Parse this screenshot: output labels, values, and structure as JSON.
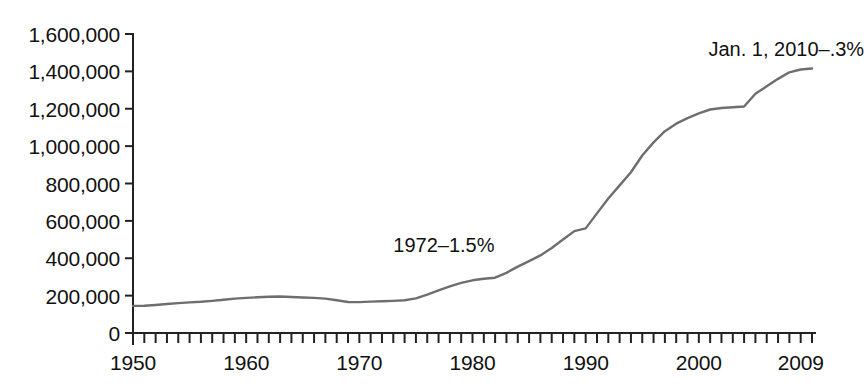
{
  "chart_data": {
    "type": "line",
    "title": "",
    "subtitle": "",
    "xlabel": "",
    "ylabel": "",
    "xlim": [
      1950,
      2010
    ],
    "ylim": [
      0,
      1600000
    ],
    "grid": false,
    "legend": "none",
    "line_color": "#6e6e6e",
    "axis_color": "#222222",
    "text_color": "#111111",
    "y_ticks": [
      0,
      200000,
      400000,
      600000,
      800000,
      1000000,
      1200000,
      1400000,
      1600000
    ],
    "y_tick_labels": [
      "0",
      "200,000",
      "400,000",
      "600,000",
      "800,000",
      "1,000,000",
      "1,200,000",
      "1,400,000",
      "1,600,000"
    ],
    "x_ticks": [
      1950,
      1960,
      1970,
      1980,
      1990,
      2000,
      2009
    ],
    "x_tick_labels": [
      "1950",
      "1960",
      "1970",
      "1980",
      "1990",
      "2000",
      "2009"
    ],
    "x_minor_tick_interval": 1,
    "annotations": [
      {
        "text": "Jan. 1, 2010–.3%",
        "x": 2003.5,
        "y": 1520000
      },
      {
        "text": "1972–1.5%",
        "x": 1973.0,
        "y": 470000
      }
    ],
    "x": [
      1950,
      1951,
      1952,
      1953,
      1954,
      1955,
      1956,
      1957,
      1958,
      1959,
      1960,
      1961,
      1962,
      1963,
      1964,
      1965,
      1966,
      1967,
      1968,
      1969,
      1970,
      1971,
      1972,
      1973,
      1974,
      1975,
      1976,
      1977,
      1978,
      1979,
      1980,
      1981,
      1982,
      1983,
      1984,
      1985,
      1986,
      1987,
      1988,
      1989,
      1990,
      1991,
      1992,
      1993,
      1994,
      1995,
      1996,
      1997,
      1998,
      1999,
      2000,
      2001,
      2002,
      2003,
      2004,
      2005,
      2006,
      2007,
      2008,
      2009,
      2010
    ],
    "values": [
      145000,
      146000,
      150000,
      155000,
      160000,
      164000,
      167000,
      172000,
      178000,
      184000,
      188000,
      191000,
      194000,
      195000,
      193000,
      190000,
      188000,
      184000,
      175000,
      166000,
      165000,
      168000,
      170000,
      172000,
      175000,
      185000,
      205000,
      228000,
      250000,
      268000,
      282000,
      290000,
      296000,
      322000,
      355000,
      385000,
      415000,
      455000,
      500000,
      545000,
      560000,
      640000,
      720000,
      790000,
      860000,
      950000,
      1020000,
      1080000,
      1120000,
      1150000,
      1175000,
      1196000,
      1204000,
      1208000,
      1212000,
      1280000,
      1320000,
      1360000,
      1395000,
      1410000,
      1415000
    ]
  }
}
